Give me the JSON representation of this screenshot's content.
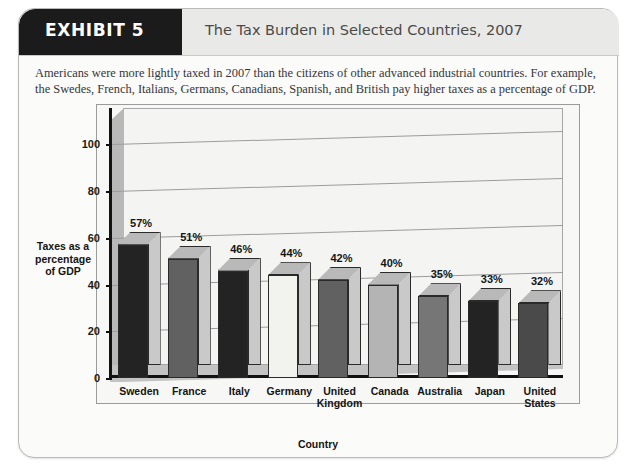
{
  "header": {
    "exhibit_label": "EXHIBIT 5",
    "title": "The Tax Burden in Selected Countries, 2007"
  },
  "caption": "Americans were more lightly taxed in 2007 than the citizens of other advanced industrial countries. For example, the Swedes, French, Italians, Germans, Canadians, Spanish, and British pay higher taxes as a percentage of GDP.",
  "chart_data": {
    "type": "bar",
    "title": "The Tax Burden in Selected Countries, 2007",
    "xlabel": "Country",
    "ylabel": "Taxes as a percentage of GDP",
    "ylabel_lines": [
      "Taxes as a",
      "percentage",
      "of GDP"
    ],
    "ylim": [
      0,
      110
    ],
    "yticks": [
      0,
      20,
      40,
      60,
      80,
      100
    ],
    "ytick_labels": [
      "0",
      "20",
      "40",
      "60",
      "80",
      "100"
    ],
    "grid": true,
    "legend": "none",
    "categories": [
      "Sweden",
      "France",
      "Italy",
      "Germany",
      "United Kingdom",
      "Canada",
      "Australia",
      "Japan",
      "United States"
    ],
    "category_lines": [
      [
        "Sweden"
      ],
      [
        "France"
      ],
      [
        "Italy"
      ],
      [
        "Germany"
      ],
      [
        "United",
        "Kingdom"
      ],
      [
        "Canada"
      ],
      [
        "Australia"
      ],
      [
        "Japan"
      ],
      [
        "United",
        "States"
      ]
    ],
    "values": [
      57,
      51,
      46,
      44,
      42,
      40,
      35,
      33,
      32
    ],
    "data_labels": [
      "57%",
      "51%",
      "46%",
      "44%",
      "42%",
      "40%",
      "35%",
      "33%",
      "32%"
    ],
    "bar_colors": [
      "#232323",
      "#616161",
      "#232323",
      "#f2f2ee",
      "#616161",
      "#b4b4b4",
      "#767676",
      "#232323",
      "#4a4a4a"
    ]
  },
  "colors": {
    "banner": "#1b1b1b",
    "header_bg": "#e9e9e7",
    "page_bg": "#fbfbfa",
    "plot_bg": "#f4f4f3",
    "axis": "#111111",
    "grid": "#9c9c9c",
    "wall": "#b8b8b8",
    "floor": "#c3c3c3"
  }
}
